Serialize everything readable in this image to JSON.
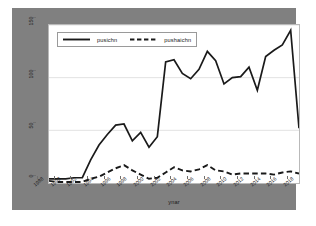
{
  "chart_data": {
    "type": "line",
    "title": "",
    "xlabel": "ynar",
    "ylabel": "",
    "xlim": [
      1988,
      2018
    ],
    "ylim": [
      0,
      150
    ],
    "grid": true,
    "grid_axis": "y",
    "legend_position": "upper left",
    "x": [
      1988,
      1989,
      1990,
      1991,
      1992,
      1993,
      1994,
      1995,
      1996,
      1997,
      1998,
      1999,
      2000,
      2001,
      2002,
      2003,
      2004,
      2005,
      2006,
      2007,
      2008,
      2009,
      2010,
      2011,
      2012,
      2013,
      2014,
      2015,
      2016,
      2017,
      2018
    ],
    "xticks": [
      1988,
      1990,
      1992,
      1994,
      1996,
      1998,
      2000,
      2002,
      2004,
      2006,
      2008,
      2010,
      2012,
      2014,
      2016,
      2018
    ],
    "xticklabels": [
      "1988",
      "1990",
      "1992",
      "1994",
      "1996",
      "1998",
      "2000",
      "2002",
      "2004",
      "2006",
      "2008",
      "2010",
      "2012",
      "2014",
      "2016",
      "2018"
    ],
    "yticks": [
      0,
      50,
      100,
      150
    ],
    "yticklabels": [
      "0",
      "50",
      "100",
      "150"
    ],
    "series": [
      {
        "name": "pusichn",
        "style": "solid",
        "color": "#1a1a1a",
        "values": [
          4,
          4,
          4,
          5,
          5,
          22,
          36,
          46,
          55,
          56,
          40,
          48,
          34,
          44,
          115,
          117,
          104,
          99,
          108,
          125,
          116,
          94,
          100,
          101,
          110,
          88,
          120,
          126,
          131,
          145,
          52
        ]
      },
      {
        "name": "pushaichn",
        "style": "dashed",
        "color": "#1a1a1a",
        "values": [
          2,
          1,
          1,
          1,
          1,
          4,
          6,
          10,
          14,
          17,
          12,
          8,
          4,
          5,
          10,
          15,
          12,
          11,
          13,
          17,
          12,
          11,
          8,
          9,
          9,
          9,
          9,
          8,
          10,
          11,
          9
        ]
      }
    ]
  },
  "legend": {
    "entries": [
      {
        "label": "pusichn",
        "style": "solid"
      },
      {
        "label": "pushaichn",
        "style": "dashed"
      }
    ]
  },
  "axis": {
    "x_title": "ynar"
  },
  "colors": {
    "figure_background": "#808080",
    "panel_background": "#ffffff",
    "line": "#1a1a1a",
    "grid": "#e2e2e2",
    "text": "#1a1a1a"
  }
}
